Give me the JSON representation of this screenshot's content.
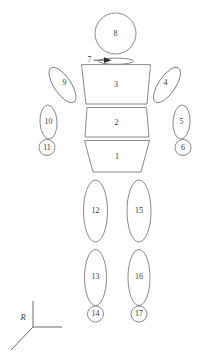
{
  "figure": {
    "background_color": "#ffffff",
    "outline_color": "#6d6d6d",
    "label_color": "#3a3a3a",
    "axis_color": "#5b5b5b"
  },
  "segments": {
    "pelvis": {
      "id": "1",
      "shape": "trapezoid",
      "label": "1"
    },
    "abdomen": {
      "id": "2",
      "shape": "trapezoid",
      "label": "2"
    },
    "thorax": {
      "id": "3",
      "shape": "trapezoid",
      "label": "3"
    },
    "right_upper_arm": {
      "id": "4",
      "shape": "ellipse",
      "label": "4"
    },
    "right_forearm": {
      "id": "5",
      "shape": "ellipse",
      "label": "5"
    },
    "right_hand": {
      "id": "6",
      "shape": "circle",
      "label": "6"
    },
    "neck": {
      "id": "7",
      "shape": "flat-ellipse",
      "label": "7"
    },
    "head": {
      "id": "8",
      "shape": "circle",
      "label": "8"
    },
    "left_upper_arm": {
      "id": "9",
      "shape": "ellipse",
      "label": "9"
    },
    "left_forearm": {
      "id": "10",
      "shape": "ellipse",
      "label": "10"
    },
    "left_hand": {
      "id": "11",
      "shape": "circle",
      "label": "11"
    },
    "left_thigh": {
      "id": "12",
      "shape": "ellipse",
      "label": "12"
    },
    "left_shank": {
      "id": "13",
      "shape": "ellipse",
      "label": "13"
    },
    "left_foot": {
      "id": "14",
      "shape": "circle",
      "label": "14"
    },
    "right_thigh": {
      "id": "15",
      "shape": "ellipse",
      "label": "15"
    },
    "right_shank": {
      "id": "16",
      "shape": "ellipse",
      "label": "16"
    },
    "right_foot": {
      "id": "17",
      "shape": "circle",
      "label": "17"
    }
  },
  "reference_frame": {
    "label": "R",
    "axes": [
      "vertical-up",
      "horizontal-right",
      "diagonal-down-left"
    ]
  },
  "annotations": {
    "neck_callout": {
      "label": "7",
      "target": "neck-segment",
      "arrow": "points-right"
    }
  }
}
